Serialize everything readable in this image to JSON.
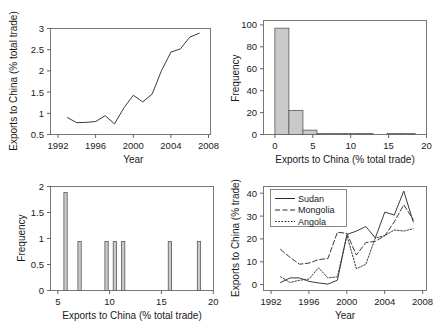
{
  "figure": {
    "panel_count": 4,
    "background": "#ffffff"
  },
  "chart_data": [
    {
      "id": "panel-a",
      "type": "line",
      "title": "",
      "xlabel": "Year",
      "ylabel": "Exports to China (% total trade)",
      "xlim": [
        1991.2,
        2008.2
      ],
      "ylim": [
        0.42,
        3.12
      ],
      "xticks": [
        1992,
        1996,
        2000,
        2004,
        2008
      ],
      "xtick_labels": [
        "1992",
        "1996",
        "2000",
        "2004",
        "2008"
      ],
      "yticks": [
        0.5,
        1,
        1.5,
        2,
        2.5,
        3
      ],
      "ytick_labels": [
        "0.5",
        "1",
        "1.5",
        "2",
        "2.5",
        "3"
      ],
      "grid": false,
      "legend": "none",
      "x": [
        1993,
        1994,
        1995,
        1996,
        1997,
        1998,
        1999,
        2000,
        2001,
        2002,
        2003,
        2004,
        2005,
        2006,
        2007
      ],
      "values": [
        0.85,
        0.72,
        0.73,
        0.75,
        0.9,
        0.69,
        1.1,
        1.42,
        1.25,
        1.45,
        2.05,
        2.52,
        2.6,
        2.9,
        3.0
      ],
      "series_name": "Exports to China"
    },
    {
      "id": "panel-b",
      "type": "bar",
      "title": "",
      "xlabel": "Exports to China (% total trade)",
      "ylabel": "Frequency",
      "xlim": [
        -1.5,
        20
      ],
      "ylim": [
        0,
        104
      ],
      "xticks": [
        0,
        5,
        10,
        15,
        20
      ],
      "xtick_labels": [
        "0",
        "5",
        "10",
        "15",
        "20"
      ],
      "yticks": [
        0,
        20,
        40,
        60,
        80,
        100
      ],
      "ytick_labels": [
        "0",
        "20",
        "40",
        "60",
        "80",
        "100"
      ],
      "grid": false,
      "legend": "none",
      "bin_edges": [
        0,
        1.85,
        3.7,
        5.55,
        7.4,
        9.25,
        11.1,
        12.95,
        14.8,
        16.65,
        18.5
      ],
      "categories": [
        "0-1.85",
        "1.85-3.7",
        "3.7-5.55",
        "5.55-7.4",
        "7.4-9.25",
        "9.25-11.1",
        "11.1-12.95",
        "12.95-14.8",
        "14.8-16.65",
        "16.65-18.5"
      ],
      "values": [
        97,
        22,
        4,
        1,
        1,
        1,
        1,
        0,
        1,
        1
      ]
    },
    {
      "id": "panel-c",
      "type": "bar",
      "title": "",
      "xlabel": "Exports to China (% total trade)",
      "ylabel": "Frequency",
      "xlim": [
        4.3,
        20
      ],
      "ylim": [
        0,
        2.12
      ],
      "xticks": [
        5,
        10,
        15,
        20
      ],
      "xtick_labels": [
        "5",
        "10",
        "15",
        "20"
      ],
      "yticks": [
        0,
        0.5,
        1,
        1.5,
        2
      ],
      "ytick_labels": [
        "0",
        "0.5",
        "1",
        "1.5",
        "2"
      ],
      "grid": false,
      "legend": "none",
      "categories": [
        "5.75",
        "7.1",
        "9.7",
        "10.5",
        "11.3",
        "15.8",
        "18.6"
      ],
      "bin_centers": [
        5.75,
        7.1,
        9.7,
        10.5,
        11.3,
        15.8,
        18.6
      ],
      "bin_width": 0.32,
      "values": [
        2,
        1,
        1,
        1,
        1,
        1,
        1
      ]
    },
    {
      "id": "panel-d",
      "type": "line",
      "title": "",
      "xlabel": "Year",
      "ylabel": "Exports to China (% trade)",
      "xlim": [
        1991.2,
        2008.4
      ],
      "ylim": [
        -2.5,
        43
      ],
      "xticks": [
        1992,
        1996,
        2000,
        2004,
        2008
      ],
      "xtick_labels": [
        "1992",
        "1996",
        "2000",
        "2004",
        "2008"
      ],
      "yticks": [
        0,
        10,
        20,
        30,
        40
      ],
      "ytick_labels": [
        "0",
        "10",
        "20",
        "30",
        "40"
      ],
      "grid": false,
      "legend": "upper-left",
      "x": [
        1993,
        1994,
        1995,
        1996,
        1997,
        1998,
        1999,
        2000,
        2001,
        2002,
        2003,
        2004,
        2005,
        2006,
        2007
      ],
      "series": [
        {
          "name": "Sudan",
          "style": "solid",
          "values": [
            1.0,
            3.0,
            3.0,
            1.5,
            0.8,
            0.3,
            2.0,
            22.0,
            23.5,
            25.5,
            20.5,
            31.8,
            30.5,
            41.0,
            27.5
          ]
        },
        {
          "name": "Mongolia",
          "style": "dashed",
          "values": [
            15.5,
            12.0,
            9.0,
            9.5,
            11.0,
            11.5,
            23.0,
            22.5,
            13.0,
            18.5,
            19.0,
            21.5,
            27.5,
            35.0,
            28.5
          ]
        },
        {
          "name": "Angola",
          "style": "dotted",
          "values": [
            3.5,
            1.0,
            2.0,
            2.5,
            7.5,
            3.0,
            3.5,
            21.5,
            7.0,
            9.0,
            20.5,
            21.5,
            24.0,
            23.5,
            24.5
          ]
        }
      ]
    }
  ]
}
